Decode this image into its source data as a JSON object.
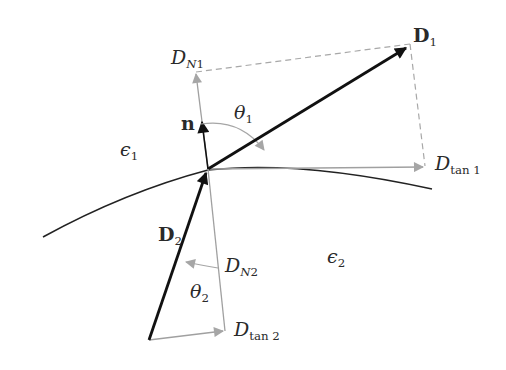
{
  "diagram": {
    "colors": {
      "background": "#ffffff",
      "vector": "#111111",
      "component": "#a0a0a0",
      "dashed": "#a8a8a8",
      "interface": "#222222",
      "text": "#2a2a2a"
    },
    "labels": {
      "D1": {
        "base": "D",
        "sub": "1"
      },
      "DN1": {
        "base": "D",
        "sub_italic": "N",
        "sub": "1"
      },
      "Dtan1": {
        "base": "D",
        "sub": "tan 1"
      },
      "n": {
        "text": "n"
      },
      "theta1": {
        "base": "θ",
        "sub": "1"
      },
      "eps1": {
        "base": "ϵ",
        "sub": "1"
      },
      "eps2": {
        "base": "ϵ",
        "sub": "2"
      },
      "D2": {
        "base": "D",
        "sub": "2"
      },
      "DN2": {
        "base": "D",
        "sub_italic": "N",
        "sub": "2"
      },
      "theta2": {
        "base": "θ",
        "sub": "2"
      },
      "Dtan2": {
        "base": "D",
        "sub": "tan 2"
      }
    },
    "geometry": {
      "origin": [
        208,
        169
      ],
      "interface_curve": "M43,237 Q120,195 208,169 T432,188",
      "D1_tip": [
        407,
        47
      ],
      "n_tip": [
        201,
        121
      ],
      "DN1_tip": [
        196,
        73
      ],
      "Dtan1_tip": [
        424,
        167
      ],
      "D1_corner": [
        411,
        44
      ],
      "D2_tail": [
        149,
        340
      ],
      "DN2_bottom": [
        225,
        331
      ],
      "Dtan2_tip": [
        224,
        331
      ]
    }
  }
}
